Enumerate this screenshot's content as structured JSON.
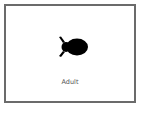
{
  "card": {
    "label": "Adult",
    "icon": "animal-silhouette-icon",
    "border_color": "#6b6b6b",
    "icon_color": "#000000"
  }
}
